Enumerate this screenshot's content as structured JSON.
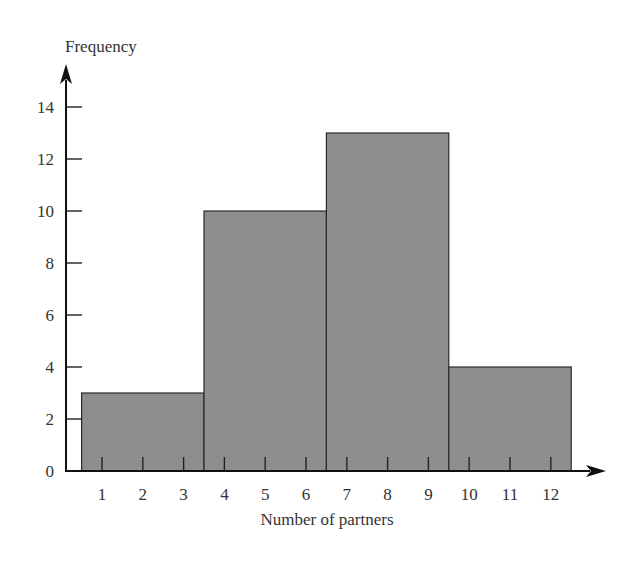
{
  "chart_data": {
    "type": "bar",
    "subtype": "histogram",
    "title": "",
    "xlabel": "Number of partners",
    "ylabel": "Frequency",
    "bins": [
      {
        "range": [
          1,
          3
        ],
        "label": "1-3",
        "value": 3
      },
      {
        "range": [
          4,
          6
        ],
        "label": "4-6",
        "value": 10
      },
      {
        "range": [
          7,
          9
        ],
        "label": "7-9",
        "value": 13
      },
      {
        "range": [
          10,
          12
        ],
        "label": "10-12",
        "value": 4
      }
    ],
    "categories": [
      "1-3",
      "4-6",
      "7-9",
      "10-12"
    ],
    "values": [
      3,
      10,
      13,
      4
    ],
    "x_ticks": [
      "1",
      "2",
      "3",
      "4",
      "5",
      "6",
      "7",
      "8",
      "9",
      "10",
      "11",
      "12"
    ],
    "y_ticks": [
      "0",
      "2",
      "4",
      "6",
      "8",
      "10",
      "12",
      "14"
    ],
    "ylim": [
      0,
      15
    ],
    "xlim": [
      0,
      13
    ],
    "grid": false,
    "legend": null,
    "colors": {
      "bar_fill": "#8e8e8e",
      "bar_stroke": "#2a2a2a",
      "axis": "#111111"
    }
  }
}
